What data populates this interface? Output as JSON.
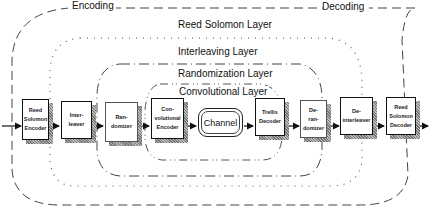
{
  "sections": {
    "encoding_label": "Encoding",
    "decoding_label": "Decoding"
  },
  "layers": [
    {
      "name": "Reed Solomon Layer",
      "style": "long-dash"
    },
    {
      "name": "Interleaving Layer",
      "style": "dotted"
    },
    {
      "name": "Randomization Layer",
      "style": "dash-dot"
    },
    {
      "name": "Convolutional Layer",
      "style": "dash-dot-dot"
    }
  ],
  "blocks": [
    {
      "id": "rs-encoder",
      "label": "Reed\nSolomon\nEncoder"
    },
    {
      "id": "interleaver",
      "label": "Inter-\nleaver"
    },
    {
      "id": "randomizer",
      "label": "Ran-\ndomizer"
    },
    {
      "id": "conv-encoder",
      "label": "Con-\nvolutional\nEncoder"
    },
    {
      "id": "channel",
      "label": "Channel"
    },
    {
      "id": "trellis-decoder",
      "label": "Trellis\nDecoder"
    },
    {
      "id": "derandomizer",
      "label": "De-\nran-\ndomizer"
    },
    {
      "id": "deinterleaver",
      "label": "De-\ninterleaver"
    },
    {
      "id": "rs-decoder",
      "label": "Reed\nSolomon\nDecoder"
    }
  ]
}
